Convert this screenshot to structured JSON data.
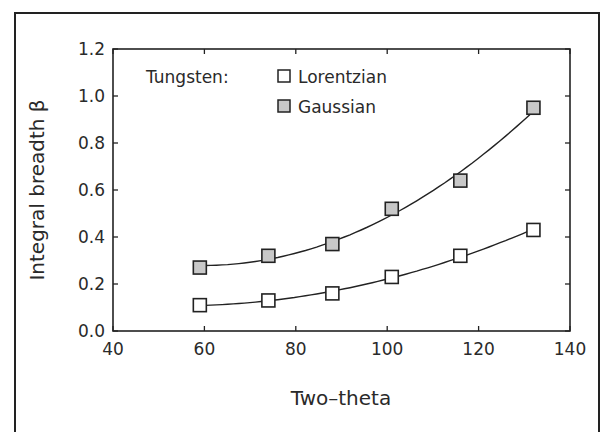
{
  "chart_data": {
    "type": "scatter",
    "title": "",
    "xlabel": "Two–theta",
    "ylabel": "Integral breadth β",
    "xlim": [
      40,
      140
    ],
    "ylim": [
      0.0,
      1.2
    ],
    "xticks": [
      "40",
      "60",
      "80",
      "100",
      "120",
      "140"
    ],
    "yticks": [
      "0.0",
      "0.2",
      "0.4",
      "0.6",
      "0.8",
      "1.0",
      "1.2"
    ],
    "grid": false,
    "legend_title": "Tungsten:",
    "legend_position": "upper-left",
    "series": [
      {
        "name": "Lorentzian",
        "marker": "open-square",
        "fit_line": true,
        "x": [
          59,
          74,
          88,
          101,
          116,
          132
        ],
        "values": [
          0.11,
          0.13,
          0.16,
          0.23,
          0.32,
          0.43
        ]
      },
      {
        "name": "Gaussian",
        "marker": "shaded-square",
        "fit_line": true,
        "x": [
          59,
          74,
          88,
          101,
          116,
          132
        ],
        "values": [
          0.27,
          0.32,
          0.37,
          0.52,
          0.64,
          0.95
        ]
      }
    ]
  },
  "colors": {
    "ink": "#222222",
    "gaussian_fill": "#c8c8c8",
    "background": "#ffffff"
  }
}
